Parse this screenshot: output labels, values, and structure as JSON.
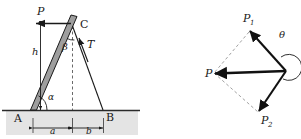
{
  "figure": {
    "background": "#ffffff",
    "stroke_color": "#1a1a1a",
    "ground_fill": "#e2e2e2",
    "beam_fill": "#9a9a9a"
  },
  "left_diagram": {
    "name": "leaning-beam-free-body-diagram",
    "labels": {
      "force_P": "P",
      "height_h": "h",
      "angle_beta": "β",
      "angle_alpha": "α",
      "tension_T": "T",
      "point_A": "A",
      "point_B": "B",
      "point_C": "C",
      "dim_a": "a",
      "dim_b": "b"
    },
    "elements": [
      "beam-AC",
      "rope-CB",
      "force-arrow-P",
      "tension-arrow-T",
      "dimension-h",
      "dimension-a",
      "dimension-b",
      "angle-arc-alpha",
      "angle-arc-beta",
      "ground-line",
      "dashed-vertical-from-C"
    ]
  },
  "right_diagram": {
    "name": "force-polygon-diagram",
    "labels": {
      "resultant_P": "P",
      "component_P1": "P",
      "component_P1_sub": "1",
      "component_P2": "P",
      "component_P2_sub": "2",
      "angle_theta": "θ"
    },
    "elements": [
      "vector-P1",
      "vector-P2",
      "resultant-vector-P",
      "dashed-parallelogram",
      "angle-arc-theta"
    ]
  }
}
